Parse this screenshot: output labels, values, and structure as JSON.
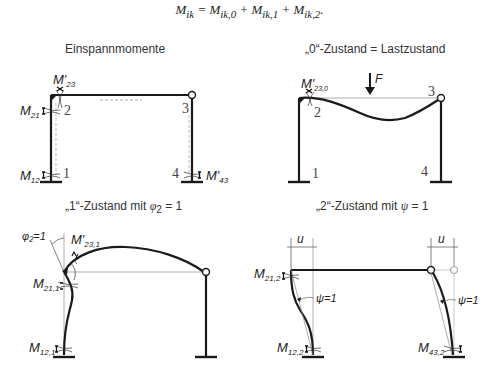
{
  "formula": "Mᵢₖ = Mᵢₖ,₀ + Mᵢₖ,₁ + Mᵢₖ,₂.",
  "panels": [
    {
      "title": "Einspannmomente",
      "nodes": [
        "1",
        "2",
        "3",
        "4"
      ],
      "moments": {
        "m23": {
          "main": "M'",
          "sub": "23"
        },
        "m21": {
          "main": "M",
          "sub": "21"
        },
        "m12": {
          "main": "M",
          "sub": "12"
        },
        "m43": {
          "main": "M'",
          "sub": "43"
        }
      }
    },
    {
      "title": "„0“-Zustand = Lastzustand",
      "nodes": [
        "1",
        "2",
        "3",
        "4"
      ],
      "load": "F",
      "moments": {
        "m230": {
          "main": "M'",
          "sub": "23,0"
        }
      }
    },
    {
      "title": "„1“-Zustand mit φ₂ = 1",
      "rotation": "φ₂=1",
      "moments": {
        "m231": {
          "main": "M'",
          "sub": "23,1"
        },
        "m211": {
          "main": "M",
          "sub": "21,1"
        },
        "m121": {
          "main": "M",
          "sub": "12,1"
        }
      }
    },
    {
      "title": "„2“-Zustand mit ψ = 1",
      "displacement": "u",
      "chord_rotation": "ψ=1",
      "moments": {
        "m212": {
          "main": "M",
          "sub": "21,2"
        },
        "m122": {
          "main": "M",
          "sub": "12,2"
        },
        "m432": {
          "main": "M",
          "sub": "43,2"
        }
      }
    }
  ],
  "colors": {
    "structure": "#1a1a1a",
    "thin": "#777777",
    "dashed": "#aaaaaa",
    "text": "#333333"
  }
}
